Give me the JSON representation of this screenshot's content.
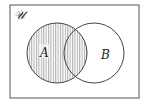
{
  "diagram": {
    "type": "venn",
    "universe_label": "𝒰",
    "sets": [
      {
        "label": "A",
        "shaded": true
      },
      {
        "label": "B",
        "shaded": false
      }
    ],
    "shaded_region": "A",
    "shading_pattern": "vertical-stripes",
    "colors": {
      "line": "#444444",
      "stripe": "#7a7a7a",
      "background": "#ffffff"
    }
  }
}
